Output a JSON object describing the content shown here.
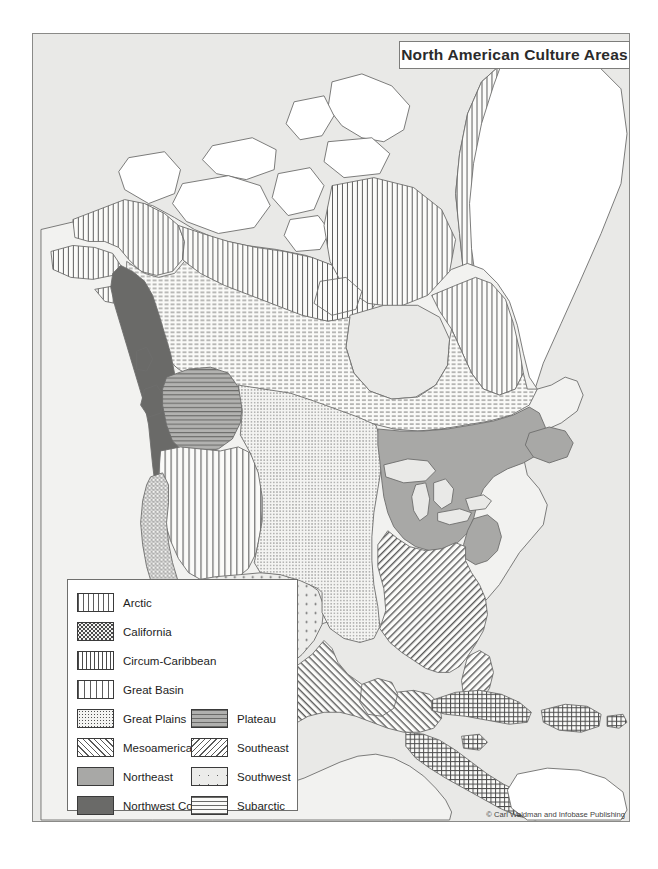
{
  "title": "North American Culture Areas",
  "credit": "© Carl Waldman and Infobase Publishing",
  "colors": {
    "page_background": "#ffffff",
    "ocean": "#e9e9e7",
    "land_default": "#f2f2f0",
    "coastline": "#6e6e6c",
    "frame_border": "#8a8a88",
    "text": "#1d1d1d"
  },
  "legend": {
    "column_1": [
      {
        "label": "Arctic",
        "pattern": "vertical-stripes",
        "swatch_class": "p-arctic"
      },
      {
        "label": "California",
        "pattern": "dense-speckle-dots",
        "swatch_class": "p-california"
      },
      {
        "label": "Circum-Caribbean",
        "pattern": "cross-hatch-grid",
        "swatch_class": "p-circum"
      },
      {
        "label": "Great Basin",
        "pattern": "wide-vertical-stripes",
        "swatch_class": "p-greatbasin"
      },
      {
        "label": "Great Plains",
        "pattern": "fine-dots",
        "swatch_class": "p-greatplains"
      },
      {
        "label": "Mesoamerica",
        "pattern": "diagonal-hatch-right",
        "swatch_class": "p-meso"
      },
      {
        "label": "Northeast",
        "pattern": "solid-medium-gray",
        "swatch_class": "p-northeast"
      },
      {
        "label": "Northwest Coast",
        "pattern": "solid-dark-gray",
        "swatch_class": "p-nwcoast"
      }
    ],
    "column_2": [
      {
        "label": "Plateau",
        "pattern": "gray-horizontal-lines",
        "swatch_class": "p-plateau"
      },
      {
        "label": "Southeast",
        "pattern": "diagonal-hatch-left",
        "swatch_class": "p-southeast"
      },
      {
        "label": "Southwest",
        "pattern": "sparse-dot-grid",
        "swatch_class": "p-southwest"
      },
      {
        "label": "Subarctic",
        "pattern": "dashed-horizontal",
        "swatch_class": "p-subarctic"
      }
    ]
  },
  "map_regions": [
    {
      "name": "Arctic",
      "locations": "Alaska north/west coast, Aleutian chain, Canadian Arctic Archipelago, Hudson Bay rim, Labrador coast, west Greenland"
    },
    {
      "name": "Subarctic",
      "locations": "Alaskan interior, most of central and northern Canada"
    },
    {
      "name": "Northwest Coast",
      "locations": "Pacific coastal strip from southern Alaska to northern California"
    },
    {
      "name": "Plateau",
      "locations": "Interior Pacific Northwest, Columbia and Fraser plateaus"
    },
    {
      "name": "Great Basin",
      "locations": "Nevada, Utah and adjacent interior West"
    },
    {
      "name": "California",
      "locations": "California coast and valleys, Baja California peninsula"
    },
    {
      "name": "Southwest",
      "locations": "Arizona, New Mexico and northern Mexico"
    },
    {
      "name": "Great Plains",
      "locations": "Central plains from Alberta/Saskatchewan to Texas"
    },
    {
      "name": "Northeast",
      "locations": "Great Lakes region, Ohio Valley, Atlantic Northeast, Maritimes"
    },
    {
      "name": "Southeast",
      "locations": "Lower Mississippi Valley and Gulf/South Atlantic states, Florida"
    },
    {
      "name": "Mesoamerica",
      "locations": "Central and southern Mexico, Guatemala, Yucatán"
    },
    {
      "name": "Circum-Caribbean",
      "locations": "Greater Antilles (Cuba, Hispaniola, Puerto Rico, Jamaica), Caribbean coasts of Central America"
    }
  ]
}
